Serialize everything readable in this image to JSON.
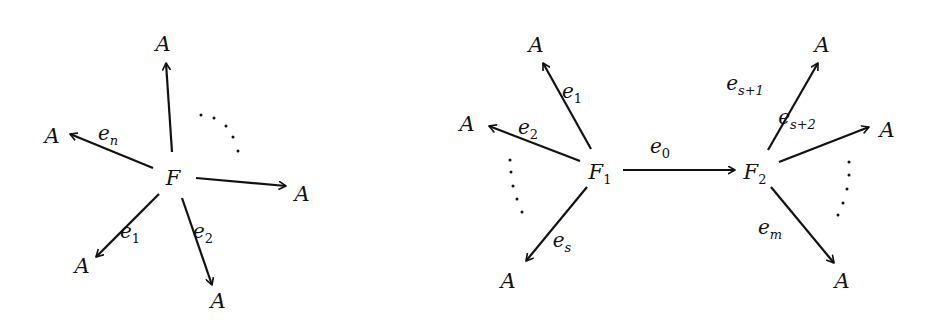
{
  "diagrams": [
    {
      "name": "star-graph",
      "center": {
        "label": "F",
        "x": 173,
        "y": 178
      },
      "nodes": [
        {
          "label": "A",
          "x": 163,
          "y": 44
        },
        {
          "label": "A",
          "x": 52,
          "y": 136
        },
        {
          "label": "A",
          "x": 302,
          "y": 194
        },
        {
          "label": "A",
          "x": 82,
          "y": 266
        },
        {
          "label": "A",
          "x": 218,
          "y": 301
        }
      ],
      "edges": [
        {
          "label": "",
          "from": [
            172,
            152
          ],
          "to": [
            166,
            63
          ]
        },
        {
          "label": "e",
          "sub": "n",
          "from": [
            153,
            168
          ],
          "to": [
            70,
            134
          ],
          "lx": 108,
          "ly": 140
        },
        {
          "label": "",
          "from": [
            196,
            178
          ],
          "to": [
            286,
            186
          ]
        },
        {
          "label": "e",
          "sub": "1",
          "from": [
            159,
            194
          ],
          "to": [
            96,
            257
          ],
          "lx": 130,
          "ly": 238
        },
        {
          "label": "e",
          "sub": "2",
          "from": [
            182,
            198
          ],
          "to": [
            212,
            285
          ],
          "lx": 203,
          "ly": 238
        }
      ],
      "ellipsis": "dotted arc between top and right edges"
    },
    {
      "name": "two-center-graph",
      "centers": [
        {
          "label": "F",
          "sub": "1",
          "x": 600,
          "y": 172
        },
        {
          "label": "F",
          "sub": "2",
          "x": 755,
          "y": 172
        }
      ],
      "nodes": [
        {
          "label": "A",
          "x": 536,
          "y": 45
        },
        {
          "label": "A",
          "x": 467,
          "y": 124
        },
        {
          "label": "A",
          "x": 508,
          "y": 281
        },
        {
          "label": "A",
          "x": 822,
          "y": 45
        },
        {
          "label": "A",
          "x": 887,
          "y": 130
        },
        {
          "label": "A",
          "x": 842,
          "y": 281
        }
      ],
      "edges": [
        {
          "label": "e",
          "sub": "1",
          "from": [
            591,
            149
          ],
          "to": [
            543,
            63
          ],
          "lx": 572,
          "ly": 98
        },
        {
          "label": "e",
          "sub": "2",
          "from": [
            580,
            161
          ],
          "to": [
            489,
            126
          ],
          "lx": 528,
          "ly": 134
        },
        {
          "label": "e",
          "sub": "s",
          "from": [
            587,
            187
          ],
          "to": [
            526,
            261
          ],
          "lx": 562,
          "ly": 247
        },
        {
          "label": "e",
          "sub": "0",
          "from": [
            623,
            170
          ],
          "to": [
            735,
            170
          ],
          "lx": 660,
          "ly": 153
        },
        {
          "label": "e",
          "sub": "s+1",
          "from": [
            768,
            150
          ],
          "to": [
            818,
            63
          ],
          "lx": 745,
          "ly": 90
        },
        {
          "label": "e",
          "sub": "s+2",
          "from": [
            779,
            162
          ],
          "to": [
            869,
            127
          ],
          "lx": 797,
          "ly": 124
        },
        {
          "label": "e",
          "sub": "m",
          "from": [
            771,
            187
          ],
          "to": [
            834,
            263
          ],
          "lx": 770,
          "ly": 234
        }
      ],
      "ellipses": [
        "dotted arc on left between e2 and es",
        "dotted arc on right between e_{s+2} and e_m"
      ]
    }
  ]
}
